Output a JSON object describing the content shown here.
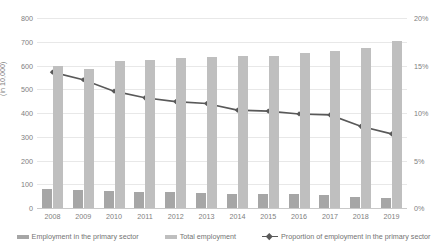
{
  "chart_data": {
    "type": "bar",
    "title": "",
    "subtitle": "",
    "xlabel": "",
    "ylabel": "(in 10,000)",
    "y2label": "",
    "categories": [
      "2008",
      "2009",
      "2010",
      "2011",
      "2012",
      "2013",
      "2014",
      "2015",
      "2016",
      "2017",
      "2018",
      "2019"
    ],
    "ylim": [
      0,
      800
    ],
    "y2lim": [
      0,
      20
    ],
    "yticks": [
      "0",
      "100",
      "200",
      "300",
      "400",
      "500",
      "600",
      "700",
      "800"
    ],
    "ytick_values": [
      0,
      100,
      200,
      300,
      400,
      500,
      600,
      700,
      800
    ],
    "y2ticks": [
      "0%",
      "5%",
      "10%",
      "15%",
      "20%"
    ],
    "y2tick_values": [
      0,
      5,
      10,
      15,
      20
    ],
    "grid": true,
    "legend_position": "bottom",
    "series": [
      {
        "name": "Employment in the primary sector",
        "type": "bar",
        "axis": "left",
        "color": "#a6a6a6",
        "values": [
          80,
          77,
          72,
          69,
          66,
          65,
          61,
          60,
          57,
          55,
          47,
          42
        ]
      },
      {
        "name": "Total employment",
        "type": "bar",
        "axis": "left",
        "color": "#bfbfbf",
        "values": [
          600,
          587,
          619,
          624,
          631,
          634,
          638,
          642,
          654,
          660,
          673,
          705
        ]
      },
      {
        "name": "Proportion of employment in the primary sector",
        "type": "line",
        "axis": "right",
        "color": "#595959",
        "marker": "diamond",
        "values": [
          14.3,
          13.5,
          12.3,
          11.6,
          11.2,
          11.0,
          10.3,
          10.2,
          9.9,
          9.8,
          8.6,
          7.8
        ]
      }
    ]
  },
  "legend": {
    "items": [
      {
        "label": "Employment in the primary sector",
        "swatch": "bar",
        "color": "#a6a6a6"
      },
      {
        "label": "Total employment",
        "swatch": "bar",
        "color": "#bfbfbf"
      },
      {
        "label": "Proportion of employment in the primary sector",
        "swatch": "line",
        "color": "#595959"
      }
    ]
  }
}
